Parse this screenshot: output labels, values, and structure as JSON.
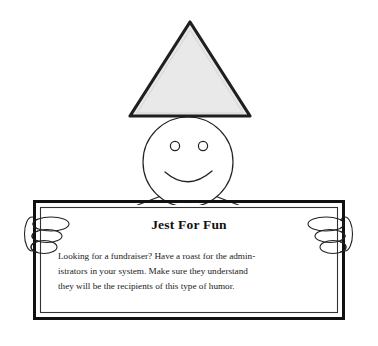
{
  "illustration": {
    "kind": "line-art-clipart",
    "description": "Stick figure with triangular party hat holding a framed sign",
    "background_color": "#ffffff",
    "ink_color": "#000000",
    "hat": {
      "name": "party-hat",
      "shape": "triangle",
      "fill_color": "#e8e8e8",
      "stroke_color": "#1a1a1a",
      "apex": [
        190,
        22
      ],
      "base_left": [
        131,
        115
      ],
      "base_right": [
        249,
        115
      ]
    },
    "head": {
      "name": "head",
      "shape": "circle",
      "fill_color": "#ffffff",
      "stroke_color": "#222222",
      "center": [
        188,
        162
      ],
      "radius": 45
    },
    "eyes": [
      {
        "center": [
          175,
          146
        ],
        "radius": 4.5
      },
      {
        "center": [
          203,
          146
        ],
        "radius": 4.5
      }
    ],
    "mouth": {
      "name": "smile",
      "shape": "arc"
    },
    "arms": [
      {
        "name": "left-arm"
      },
      {
        "name": "right-arm"
      }
    ],
    "hands": [
      {
        "name": "left-hand",
        "thumb": "vertical-ellipse",
        "fingers": 3
      },
      {
        "name": "right-hand",
        "thumb": "vertical-ellipse",
        "fingers": 3
      }
    ]
  },
  "sign": {
    "name": "held-sign",
    "frame": {
      "outer": [
        33,
        200,
        312,
        120
      ],
      "style": "double-line",
      "stroke_color": "#111111",
      "fill_color": "#ffffff"
    },
    "title": "Jest For Fun",
    "body_lines": [
      "Looking for a fundraiser? Have a roast for the admin-",
      "istrators in your system. Make sure they understand",
      "they will be the recipients of this type of humor."
    ],
    "body_text": "Looking for a fundraiser? Have a roast for the administrators in your system. Make sure they understand they will be the recipients of this type of humor."
  }
}
